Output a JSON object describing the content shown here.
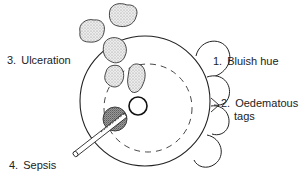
{
  "diagram": {
    "type": "medical-illustration",
    "colors": {
      "line": "#222222",
      "stipple": "#bdbdbd",
      "sepsis_fill": "#8a8a8a",
      "background": "#ffffff"
    },
    "labels": [
      {
        "id": "bluish-hue",
        "number": "1.",
        "text": "Bluish hue"
      },
      {
        "id": "oedematous-tags",
        "number": "2.",
        "text": "Oedematous",
        "text2": "tags"
      },
      {
        "id": "ulceration",
        "number": "3.",
        "text": "Ulceration"
      },
      {
        "id": "sepsis",
        "number": "4.",
        "text": "Sepsis"
      }
    ]
  }
}
